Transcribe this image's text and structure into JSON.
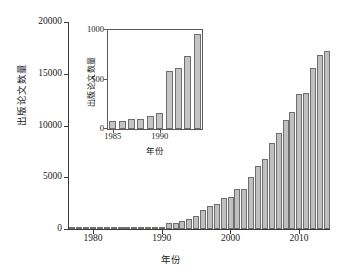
{
  "chart_data": [
    {
      "id": "main",
      "type": "bar",
      "title": "",
      "xlabel": "年份",
      "ylabel": "出版论文数量",
      "xlim": [
        1976.5,
        2014.5
      ],
      "ylim": [
        0,
        20000
      ],
      "grid": false,
      "legend": null,
      "ytick_labels": [
        "0",
        "5000",
        "10000",
        "15000",
        "20000"
      ],
      "ytick_values": [
        0,
        5000,
        10000,
        15000,
        20000
      ],
      "xtick_labels": [
        "1980",
        "1990",
        "2000",
        "2010"
      ],
      "xtick_values": [
        1980,
        1990,
        2000,
        2010
      ],
      "categories": [
        1977,
        1978,
        1979,
        1980,
        1981,
        1982,
        1983,
        1984,
        1985,
        1986,
        1987,
        1988,
        1989,
        1990,
        1991,
        1992,
        1993,
        1994,
        1995,
        1996,
        1997,
        1998,
        1999,
        2000,
        2001,
        2002,
        2003,
        2004,
        2005,
        2006,
        2007,
        2008,
        2009,
        2010,
        2011,
        2012,
        2013,
        2014
      ],
      "values": [
        20,
        25,
        30,
        40,
        55,
        60,
        75,
        80,
        85,
        85,
        100,
        105,
        130,
        160,
        590,
        620,
        740,
        960,
        1300,
        1800,
        2200,
        2450,
        3000,
        3100,
        3850,
        3900,
        5050,
        6050,
        6800,
        8300,
        9300,
        10500,
        11300,
        13000,
        13100,
        15600,
        16800,
        17200
      ]
    },
    {
      "id": "inset",
      "type": "bar",
      "title": "",
      "xlabel": "年份",
      "ylabel": "出版论文数量",
      "xlim": [
        1984.5,
        1994.5
      ],
      "ylim": [
        0,
        1000
      ],
      "grid": false,
      "legend": null,
      "ytick_labels": [
        "0",
        "500",
        "1000"
      ],
      "ytick_values": [
        0,
        500,
        1000
      ],
      "xtick_labels": [
        "1985",
        "1990"
      ],
      "xtick_values": [
        1985,
        1990
      ],
      "categories": [
        1985,
        1986,
        1987,
        1988,
        1989,
        1990,
        1991,
        1992,
        1993,
        1994
      ],
      "values": [
        85,
        85,
        100,
        105,
        130,
        160,
        590,
        620,
        740,
        960
      ]
    }
  ]
}
